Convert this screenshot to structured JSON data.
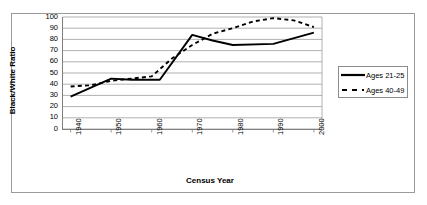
{
  "chart_data": {
    "type": "line",
    "title": "",
    "xlabel": "Census Year",
    "ylabel": "Black/White Ratio",
    "xlim": [
      1938,
      2002
    ],
    "ylim": [
      0,
      100
    ],
    "xticks": [
      "1940",
      "1950",
      "1960",
      "1970",
      "1980",
      "1990",
      "2000"
    ],
    "yticks": [
      "0",
      "10",
      "20",
      "30",
      "40",
      "50",
      "60",
      "70",
      "80",
      "90",
      "100"
    ],
    "grid": "horizontal",
    "legend_position": "right",
    "series": [
      {
        "name": "Ages 21-25",
        "style": "solid",
        "color": "#000000",
        "x": [
          1940,
          1950,
          1955,
          1960,
          1962,
          1970,
          1975,
          1980,
          1990,
          2000
        ],
        "values": [
          29,
          45,
          44,
          44,
          44,
          84,
          79,
          75,
          76,
          86
        ]
      },
      {
        "name": "Ages 40-49",
        "style": "dashed",
        "color": "#000000",
        "x": [
          1940,
          1945,
          1950,
          1955,
          1960,
          1965,
          1970,
          1975,
          1980,
          1985,
          1990,
          1995,
          2000
        ],
        "values": [
          38,
          39,
          43,
          45,
          47,
          63,
          75,
          85,
          90,
          96,
          99,
          97,
          91
        ]
      }
    ]
  },
  "legend": {
    "entries": [
      {
        "label": "Ages 21-25"
      },
      {
        "label": "Ages 40-49"
      }
    ]
  }
}
